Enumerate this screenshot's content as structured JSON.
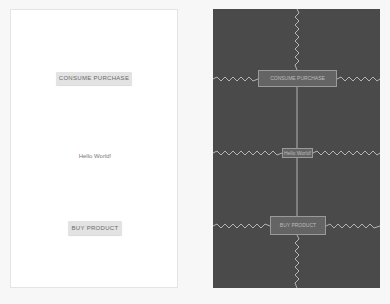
{
  "design_view": {
    "consume_button": "CONSUME PURCHASE",
    "text_view": "Hello World!",
    "buy_button": "BUY PRODUCT"
  },
  "blueprint_view": {
    "consume_button": "CONSUME PURCHASE",
    "text_view": "Hello World!",
    "buy_button": "BUY PRODUCT"
  },
  "colors": {
    "blueprint_bg": "#4a4a4a",
    "design_bg": "#ffffff",
    "button_bg": "#e3e3e3",
    "constraint": "#d0d0d0"
  }
}
